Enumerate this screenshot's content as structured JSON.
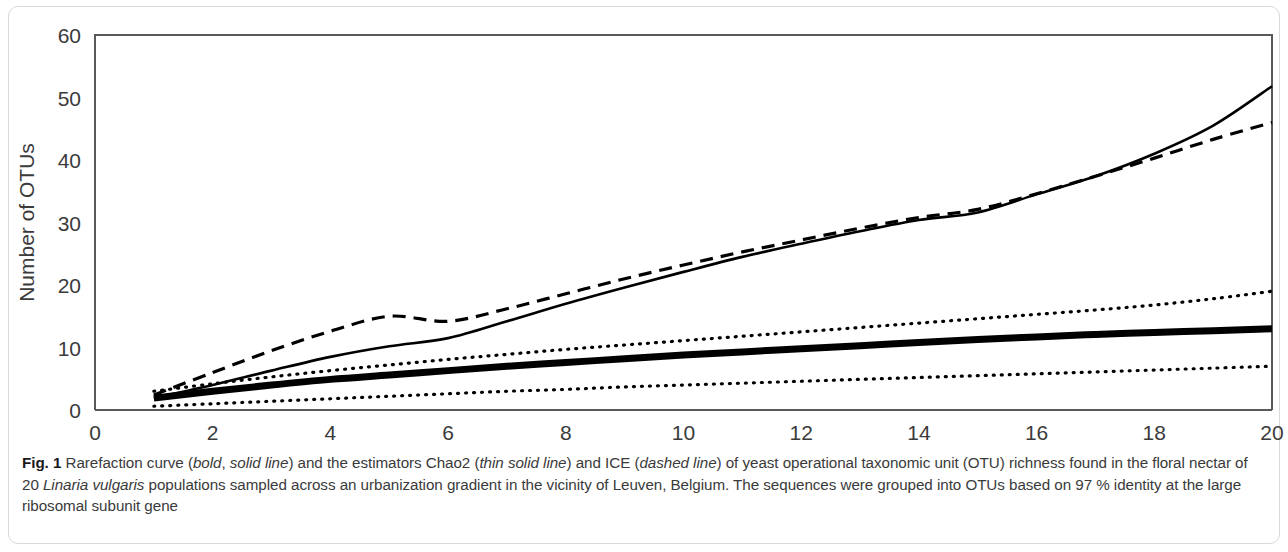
{
  "figure": {
    "label": "Fig. 1",
    "caption_segments": [
      {
        "text": "Rarefaction curve (",
        "style": "normal"
      },
      {
        "text": "bold",
        "style": "italic"
      },
      {
        "text": ", ",
        "style": "normal"
      },
      {
        "text": "solid line",
        "style": "italic"
      },
      {
        "text": ") and the estimators Chao2 (",
        "style": "normal"
      },
      {
        "text": "thin solid line",
        "style": "italic"
      },
      {
        "text": ") and ICE (",
        "style": "normal"
      },
      {
        "text": "dashed line",
        "style": "italic"
      },
      {
        "text": ") of yeast operational taxonomic unit (OTU) richness found in the floral nectar of 20 ",
        "style": "normal"
      },
      {
        "text": "Linaria vulgaris",
        "style": "italic"
      },
      {
        "text": " populations sampled across an urbanization gradient in the vicinity of Leuven, Belgium. The sequences were grouped into OTUs based on 97 % identity at the large ribosomal subunit gene",
        "style": "normal"
      }
    ]
  },
  "chart_data": {
    "type": "line",
    "title": "",
    "xlabel": "Number of populations",
    "ylabel": "Number of OTUs",
    "xlim": [
      0,
      20
    ],
    "ylim": [
      0,
      60
    ],
    "xticks": [
      0,
      2,
      4,
      6,
      8,
      10,
      12,
      14,
      16,
      18,
      20
    ],
    "xtick_labels": [
      "0",
      "2",
      "4",
      "6",
      "8",
      "10",
      "12",
      "14",
      "16",
      "18",
      "20"
    ],
    "yticks": [
      0,
      10,
      20,
      30,
      40,
      50,
      60
    ],
    "ytick_labels": [
      "0",
      "10",
      "20",
      "30",
      "40",
      "50",
      "60"
    ],
    "grid": false,
    "legend": "none",
    "line_color": "#000000",
    "x": [
      1,
      2,
      3,
      4,
      5,
      6,
      7,
      8,
      9,
      10,
      11,
      12,
      13,
      14,
      15,
      16,
      17,
      18,
      19,
      20
    ],
    "series": [
      {
        "name": "Rarefaction curve",
        "style": "bold solid line",
        "stroke_width": 7,
        "dash": "none",
        "values": [
          1.9,
          3.0,
          4.0,
          4.9,
          5.6,
          6.3,
          7.0,
          7.6,
          8.2,
          8.8,
          9.3,
          9.8,
          10.3,
          10.8,
          11.3,
          11.7,
          12.1,
          12.4,
          12.7,
          13.0
        ]
      },
      {
        "name": "Chao2",
        "style": "thin solid line",
        "stroke_width": 2.6,
        "dash": "none",
        "values": [
          1.9,
          4.0,
          6.3,
          8.5,
          10.2,
          11.5,
          14.2,
          17.0,
          19.6,
          22.1,
          24.5,
          26.6,
          28.6,
          30.4,
          31.6,
          34.5,
          37.4,
          41.0,
          45.5,
          51.8
        ]
      },
      {
        "name": "ICE",
        "style": "dashed line",
        "stroke_width": 3.2,
        "dash": "13,8",
        "values": [
          2.4,
          6.0,
          9.5,
          12.6,
          15.0,
          14.2,
          16.2,
          18.6,
          21.0,
          23.2,
          25.3,
          27.2,
          29.1,
          30.8,
          32.1,
          34.6,
          37.4,
          40.3,
          43.3,
          46.0
        ]
      },
      {
        "name": "Upper confidence bound",
        "style": "dotted line",
        "stroke_width": 3.2,
        "dash": "1,7",
        "values": [
          3.0,
          4.2,
          5.3,
          6.3,
          7.2,
          8.1,
          8.9,
          9.7,
          10.4,
          11.1,
          11.8,
          12.5,
          13.2,
          13.9,
          14.6,
          15.3,
          16.0,
          16.8,
          17.8,
          19.0
        ]
      },
      {
        "name": "Lower confidence bound",
        "style": "dotted line",
        "stroke_width": 3.2,
        "dash": "1,7",
        "values": [
          0.6,
          1.0,
          1.4,
          1.8,
          2.2,
          2.6,
          3.0,
          3.3,
          3.7,
          4.0,
          4.3,
          4.6,
          4.9,
          5.2,
          5.5,
          5.8,
          6.1,
          6.4,
          6.7,
          7.0
        ]
      }
    ]
  }
}
